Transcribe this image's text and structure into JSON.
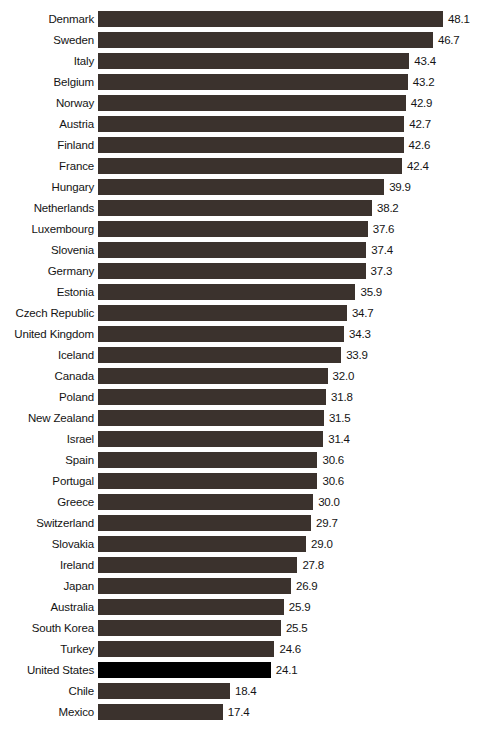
{
  "chart_data": {
    "type": "bar",
    "orientation": "horizontal",
    "title": "",
    "subtitle": "",
    "xlabel": "",
    "ylabel": "",
    "xlim": [
      0,
      48.1
    ],
    "grid": false,
    "legend": null,
    "value_labels": true,
    "value_format": "one-decimal",
    "sort": "descending",
    "bar_color": "#3b322d",
    "highlight_color": "#000000",
    "highlighted_categories": [
      "United States"
    ],
    "categories": [
      "Denmark",
      "Sweden",
      "Italy",
      "Belgium",
      "Norway",
      "Austria",
      "Finland",
      "France",
      "Hungary",
      "Netherlands",
      "Luxembourg",
      "Slovenia",
      "Germany",
      "Estonia",
      "Czech Republic",
      "United Kingdom",
      "Iceland",
      "Canada",
      "Poland",
      "New Zealand",
      "Israel",
      "Spain",
      "Portugal",
      "Greece",
      "Switzerland",
      "Slovakia",
      "Ireland",
      "Japan",
      "Australia",
      "South Korea",
      "Turkey",
      "United States",
      "Chile",
      "Mexico"
    ],
    "values": [
      48.1,
      46.7,
      43.4,
      43.2,
      42.9,
      42.7,
      42.6,
      42.4,
      39.9,
      38.2,
      37.6,
      37.4,
      37.3,
      35.9,
      34.7,
      34.3,
      33.9,
      32.0,
      31.8,
      31.5,
      31.4,
      30.6,
      30.6,
      30.0,
      29.7,
      29.0,
      27.8,
      26.9,
      25.9,
      25.5,
      24.6,
      24.1,
      18.4,
      17.4
    ],
    "bars": [
      {
        "label": "Denmark",
        "value": 48.1,
        "value_text": "48.1",
        "highlight": false
      },
      {
        "label": "Sweden",
        "value": 46.7,
        "value_text": "46.7",
        "highlight": false
      },
      {
        "label": "Italy",
        "value": 43.4,
        "value_text": "43.4",
        "highlight": false
      },
      {
        "label": "Belgium",
        "value": 43.2,
        "value_text": "43.2",
        "highlight": false
      },
      {
        "label": "Norway",
        "value": 42.9,
        "value_text": "42.9",
        "highlight": false
      },
      {
        "label": "Austria",
        "value": 42.7,
        "value_text": "42.7",
        "highlight": false
      },
      {
        "label": "Finland",
        "value": 42.6,
        "value_text": "42.6",
        "highlight": false
      },
      {
        "label": "France",
        "value": 42.4,
        "value_text": "42.4",
        "highlight": false
      },
      {
        "label": "Hungary",
        "value": 39.9,
        "value_text": "39.9",
        "highlight": false
      },
      {
        "label": "Netherlands",
        "value": 38.2,
        "value_text": "38.2",
        "highlight": false
      },
      {
        "label": "Luxembourg",
        "value": 37.6,
        "value_text": "37.6",
        "highlight": false
      },
      {
        "label": "Slovenia",
        "value": 37.4,
        "value_text": "37.4",
        "highlight": false
      },
      {
        "label": "Germany",
        "value": 37.3,
        "value_text": "37.3",
        "highlight": false
      },
      {
        "label": "Estonia",
        "value": 35.9,
        "value_text": "35.9",
        "highlight": false
      },
      {
        "label": "Czech Republic",
        "value": 34.7,
        "value_text": "34.7",
        "highlight": false
      },
      {
        "label": "United Kingdom",
        "value": 34.3,
        "value_text": "34.3",
        "highlight": false
      },
      {
        "label": "Iceland",
        "value": 33.9,
        "value_text": "33.9",
        "highlight": false
      },
      {
        "label": "Canada",
        "value": 32.0,
        "value_text": "32.0",
        "highlight": false
      },
      {
        "label": "Poland",
        "value": 31.8,
        "value_text": "31.8",
        "highlight": false
      },
      {
        "label": "New Zealand",
        "value": 31.5,
        "value_text": "31.5",
        "highlight": false
      },
      {
        "label": "Israel",
        "value": 31.4,
        "value_text": "31.4",
        "highlight": false
      },
      {
        "label": "Spain",
        "value": 30.6,
        "value_text": "30.6",
        "highlight": false
      },
      {
        "label": "Portugal",
        "value": 30.6,
        "value_text": "30.6",
        "highlight": false
      },
      {
        "label": "Greece",
        "value": 30.0,
        "value_text": "30.0",
        "highlight": false
      },
      {
        "label": "Switzerland",
        "value": 29.7,
        "value_text": "29.7",
        "highlight": false
      },
      {
        "label": "Slovakia",
        "value": 29.0,
        "value_text": "29.0",
        "highlight": false
      },
      {
        "label": "Ireland",
        "value": 27.8,
        "value_text": "27.8",
        "highlight": false
      },
      {
        "label": "Japan",
        "value": 26.9,
        "value_text": "26.9",
        "highlight": false
      },
      {
        "label": "Australia",
        "value": 25.9,
        "value_text": "25.9",
        "highlight": false
      },
      {
        "label": "South Korea",
        "value": 25.5,
        "value_text": "25.5",
        "highlight": false
      },
      {
        "label": "Turkey",
        "value": 24.6,
        "value_text": "24.6",
        "highlight": false
      },
      {
        "label": "United States",
        "value": 24.1,
        "value_text": "24.1",
        "highlight": true
      },
      {
        "label": "Chile",
        "value": 18.4,
        "value_text": "18.4",
        "highlight": false
      },
      {
        "label": "Mexico",
        "value": 17.4,
        "value_text": "17.4",
        "highlight": false
      }
    ]
  },
  "caption": {
    "text": ""
  }
}
